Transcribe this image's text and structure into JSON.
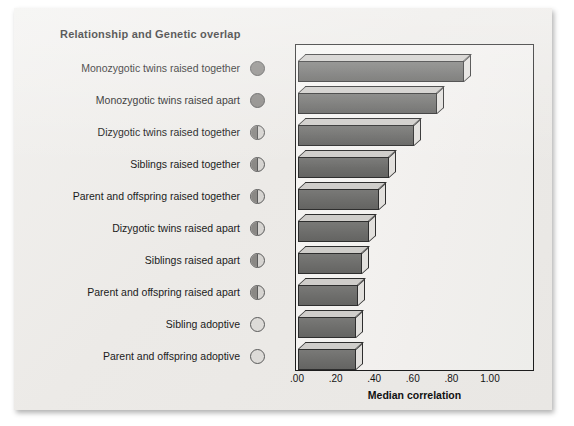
{
  "header": {
    "title": "Relationship and Genetic overlap"
  },
  "axis": {
    "title": "Median correlation",
    "ticks": [
      ".00",
      ".20",
      ".40",
      ".60",
      ".80",
      "1.00"
    ]
  },
  "chart_data": {
    "type": "bar",
    "orientation": "horizontal",
    "title": "Relationship and Genetic overlap",
    "xlabel": "Median correlation",
    "ylabel": "",
    "xlim": [
      0.0,
      1.0
    ],
    "xticks": [
      0.0,
      0.2,
      0.4,
      0.6,
      0.8,
      1.0
    ],
    "xticklabels": [
      ".00",
      ".20",
      ".40",
      ".60",
      ".80",
      "1.00"
    ],
    "grid": false,
    "legend": "none",
    "style": "3d-horizontal-bars",
    "categories": [
      "Monozygotic twins raised together",
      "Monozygotic twins raised apart",
      "Dizygotic twins raised together",
      "Siblings raised together",
      "Parent and offspring raised together",
      "Dizygotic twins raised apart",
      "Siblings raised apart",
      "Parent and offspring raised apart",
      "Sibling adoptive",
      "Parent and offspring adoptive"
    ],
    "values": [
      0.86,
      0.72,
      0.6,
      0.47,
      0.42,
      0.37,
      0.33,
      0.31,
      0.3,
      0.3
    ],
    "genetic_overlap": [
      "full",
      "full",
      "half",
      "half",
      "half",
      "half",
      "half",
      "half",
      "empty",
      "empty"
    ],
    "colors": {
      "bar_face": "#6d6d6b",
      "bar_top": "#cfcdca",
      "bar_side": "#e2e0dd",
      "outline": "#2e2e2e",
      "plot_background": "#f2f0ee",
      "panel_background": "#eceae7",
      "text": "#1b1b1b"
    }
  }
}
